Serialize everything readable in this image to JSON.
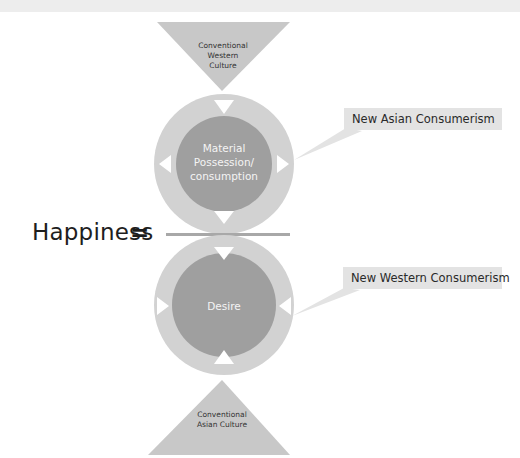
{
  "diagram": {
    "top_triangle": {
      "lines": [
        "Conventional",
        "Western",
        "Culture"
      ]
    },
    "upper_circle": {
      "lines": [
        "Material",
        "Possession/",
        "consumption"
      ]
    },
    "lower_circle": {
      "lines": [
        "Desire"
      ]
    },
    "bottom_triangle": {
      "lines": [
        "Conventional",
        "Asian Culture"
      ]
    },
    "callouts": [
      {
        "label": "New Asian Consumerism"
      },
      {
        "label": "New Western Consumerism"
      }
    ],
    "equation": {
      "lhs": "Happiness",
      "operator": "="
    },
    "colors": {
      "triangle": "#c8c8c8",
      "ring": "#d2d2d2",
      "core": "#9f9f9f",
      "callout_bg": "#e3e3e3",
      "fraction_line": "#a8a8a8",
      "arrow": "#ffffff"
    }
  }
}
